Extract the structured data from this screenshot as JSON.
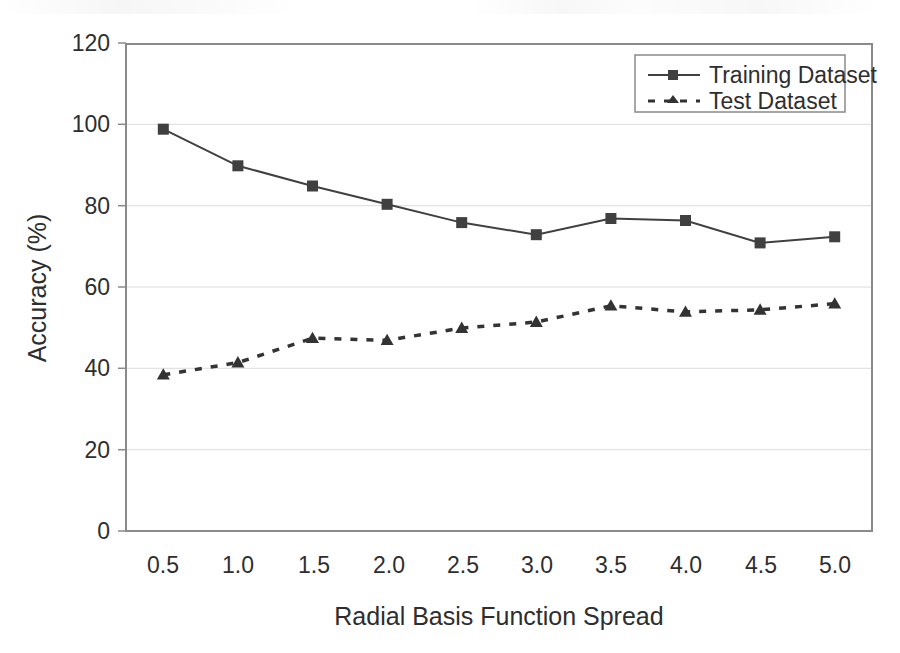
{
  "chart_data": {
    "type": "line",
    "title": "",
    "xlabel": "Radial Basis Function Spread",
    "ylabel": "Accuracy (%)",
    "x": [
      0.5,
      1.0,
      1.5,
      2.0,
      2.5,
      3.0,
      3.5,
      4.0,
      4.5,
      5.0
    ],
    "x_tick_labels": [
      "0.5",
      "1.0",
      "1.5",
      "2.0",
      "2.5",
      "3.0",
      "3.5",
      "4.0",
      "4.5",
      "5.0"
    ],
    "y_tick_labels": [
      "0",
      "20",
      "40",
      "60",
      "80",
      "100",
      "120"
    ],
    "y_ticks": [
      0,
      20,
      40,
      60,
      80,
      100,
      120
    ],
    "xlim": [
      0.25,
      5.25
    ],
    "ylim": [
      0,
      120
    ],
    "grid": "horizontal",
    "legend_position": "top-right",
    "series": [
      {
        "name": "Training Dataset",
        "marker": "square",
        "line_style": "solid",
        "color": "#404040",
        "values": [
          99,
          90,
          85,
          80.5,
          76,
          73,
          77,
          76.5,
          71,
          72.5
        ]
      },
      {
        "name": "Test Dataset",
        "marker": "triangle",
        "line_style": "dashed",
        "color": "#333333",
        "values": [
          38.5,
          41.5,
          47.5,
          47,
          50,
          51.5,
          55.5,
          54,
          54.5,
          56
        ]
      }
    ]
  },
  "legend": {
    "items": [
      {
        "label": "Training Dataset"
      },
      {
        "label": "Test Dataset"
      }
    ]
  },
  "axes": {
    "x_title": "Radial Basis Function Spread",
    "y_title": "Accuracy (%)"
  }
}
